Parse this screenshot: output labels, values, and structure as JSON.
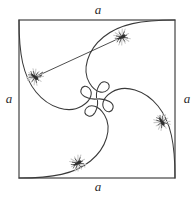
{
  "figure": {
    "background_color": "#ffffff",
    "stroke_color": "#3a3a3a",
    "square_stroke_color": "#4a4a4a",
    "bug_body_color": "#2e2e2e",
    "bug_halo_color": "#d8d8d8",
    "square": {
      "x": 19,
      "y": 20,
      "width": 156,
      "height": 158,
      "side_label": "a"
    },
    "labels": {
      "top": "a",
      "right": "a",
      "bottom": "a",
      "left": "a"
    },
    "center": {
      "x": 97,
      "y": 99
    },
    "bugs": [
      {
        "id": "bug-top-right",
        "x": 122,
        "y": 37,
        "angle": -28
      },
      {
        "id": "bug-left",
        "x": 35,
        "y": 77,
        "angle": 36
      },
      {
        "id": "bug-bottom",
        "x": 78,
        "y": 163,
        "angle": -30
      },
      {
        "id": "bug-right",
        "x": 162,
        "y": 122,
        "angle": 56
      }
    ],
    "pursuit_line": {
      "from_bug": "bug-left",
      "to_bug": "bug-top-right",
      "x1": 35,
      "y1": 77,
      "x2": 122,
      "y2": 37
    },
    "spirals": [
      {
        "id": "spiral-from-top-left",
        "start_corner": "top-left",
        "start": [
          19,
          20
        ]
      },
      {
        "id": "spiral-from-top-right",
        "start_corner": "top-right",
        "start": [
          175,
          20
        ]
      },
      {
        "id": "spiral-from-bottom-right",
        "start_corner": "bottom-right",
        "start": [
          175,
          178
        ]
      },
      {
        "id": "spiral-from-bottom-left",
        "start_corner": "bottom-left",
        "start": [
          19,
          178
        ]
      }
    ]
  },
  "chart_data": {
    "type": "line",
    "xlabel": "",
    "ylabel": "",
    "xlim": [
      0,
      1
    ],
    "ylim": [
      0,
      1
    ],
    "grid": false,
    "legend": "none",
    "annotations": [
      "a",
      "a",
      "a",
      "a"
    ],
    "categories": [
      "top",
      "right",
      "bottom",
      "left"
    ],
    "series": [
      {
        "name": "spiral-from-top-left",
        "description": "Logarithmic pursuit spiral starting at the top-left corner, turning clockwise into the centre",
        "points": [
          [
            0.0,
            1.0
          ],
          [
            0.03,
            0.85
          ],
          [
            0.07,
            0.72
          ],
          [
            0.12,
            0.6
          ],
          [
            0.19,
            0.49
          ],
          [
            0.27,
            0.4
          ],
          [
            0.36,
            0.34
          ],
          [
            0.44,
            0.33
          ],
          [
            0.5,
            0.36
          ],
          [
            0.54,
            0.42
          ],
          [
            0.54,
            0.48
          ],
          [
            0.51,
            0.5
          ],
          [
            0.5,
            0.5
          ]
        ]
      },
      {
        "name": "spiral-from-top-right",
        "description": "Logarithmic pursuit spiral starting at the top-right corner",
        "points": [
          [
            1.0,
            1.0
          ],
          [
            0.85,
            0.97
          ],
          [
            0.72,
            0.93
          ],
          [
            0.6,
            0.88
          ],
          [
            0.49,
            0.81
          ],
          [
            0.4,
            0.73
          ],
          [
            0.34,
            0.64
          ],
          [
            0.33,
            0.56
          ],
          [
            0.36,
            0.5
          ],
          [
            0.42,
            0.46
          ],
          [
            0.48,
            0.46
          ],
          [
            0.5,
            0.49
          ],
          [
            0.5,
            0.5
          ]
        ]
      },
      {
        "name": "spiral-from-bottom-right",
        "description": "Logarithmic pursuit spiral starting at the bottom-right corner",
        "points": [
          [
            1.0,
            0.0
          ],
          [
            0.97,
            0.15
          ],
          [
            0.93,
            0.28
          ],
          [
            0.88,
            0.4
          ],
          [
            0.81,
            0.51
          ],
          [
            0.73,
            0.6
          ],
          [
            0.64,
            0.66
          ],
          [
            0.56,
            0.67
          ],
          [
            0.5,
            0.64
          ],
          [
            0.46,
            0.58
          ],
          [
            0.46,
            0.52
          ],
          [
            0.49,
            0.5
          ],
          [
            0.5,
            0.5
          ]
        ]
      },
      {
        "name": "spiral-from-bottom-left",
        "description": "Logarithmic pursuit spiral starting at the bottom-left corner",
        "points": [
          [
            0.0,
            0.0
          ],
          [
            0.15,
            0.03
          ],
          [
            0.28,
            0.07
          ],
          [
            0.4,
            0.12
          ],
          [
            0.51,
            0.19
          ],
          [
            0.6,
            0.27
          ],
          [
            0.66,
            0.36
          ],
          [
            0.67,
            0.44
          ],
          [
            0.64,
            0.5
          ],
          [
            0.58,
            0.54
          ],
          [
            0.52,
            0.54
          ],
          [
            0.5,
            0.51
          ],
          [
            0.5,
            0.5
          ]
        ]
      },
      {
        "name": "pursuit-chord",
        "description": "Straight segment joining the left bug to the bug it is chasing at the top right",
        "points": [
          [
            0.1,
            0.64
          ],
          [
            0.66,
            0.89
          ]
        ]
      }
    ],
    "markers": [
      {
        "name": "bug-top-right",
        "x": 0.66,
        "y": 0.89
      },
      {
        "name": "bug-left",
        "x": 0.1,
        "y": 0.64
      },
      {
        "name": "bug-bottom",
        "x": 0.38,
        "y": 0.09
      },
      {
        "name": "bug-right",
        "x": 0.92,
        "y": 0.35
      }
    ]
  }
}
